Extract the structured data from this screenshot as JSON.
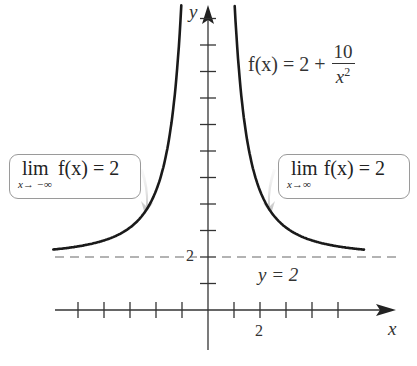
{
  "chart_data": {
    "type": "line",
    "title": "",
    "function": "f(x) = 2 + 10/x^2",
    "xlabel": "x",
    "ylabel": "y",
    "x_tick_step": 1,
    "x_ticks": [
      -5,
      -4,
      -3,
      -2,
      -1,
      1,
      2,
      3,
      4,
      5
    ],
    "x_tick_labels": [
      {
        "value": 2,
        "label": "2"
      }
    ],
    "y_ticks": [
      1,
      2,
      3,
      4,
      5,
      6,
      7,
      8,
      9,
      10,
      11
    ],
    "y_tick_labels": [
      {
        "value": 2,
        "label": "2"
      }
    ],
    "xlim": [
      -6,
      7
    ],
    "ylim": [
      -2,
      12
    ],
    "grid": false,
    "series": [
      {
        "name": "f(x) = 2 + 10/x^2 (left branch)",
        "x": [
          -6,
          -5,
          -4,
          -3,
          -2,
          -1.5,
          -1.2,
          -1.0
        ],
        "y": [
          2.28,
          2.4,
          2.63,
          3.11,
          4.5,
          6.44,
          8.94,
          12.0
        ]
      },
      {
        "name": "f(x) = 2 + 10/x^2 (right branch)",
        "x": [
          1.0,
          1.2,
          1.5,
          2,
          3,
          4,
          5,
          6
        ],
        "y": [
          12.0,
          8.94,
          6.44,
          4.5,
          3.11,
          2.63,
          2.4,
          2.28
        ]
      }
    ],
    "asymptote": {
      "type": "horizontal",
      "y": 2,
      "label": "y = 2",
      "style": "dashed"
    },
    "annotations": [
      {
        "text": "f(x) = 2 + 10/x²",
        "position": "upper right"
      },
      {
        "text": "lim x→−∞ f(x) = 2",
        "position": "left callout"
      },
      {
        "text": "lim x→∞ f(x) = 2",
        "position": "right callout"
      },
      {
        "text": "y = 2",
        "position": "below asymptote, right"
      }
    ]
  },
  "axes": {
    "x_label": "x",
    "y_label": "y",
    "x_tick_label": "2",
    "y_tick_label": "2"
  },
  "formula": {
    "lhs": "f(x) = 2 +",
    "numerator": "10",
    "denominator_base": "x",
    "denominator_exp": "2"
  },
  "asymptote_label": "y = 2",
  "callouts": {
    "left": {
      "lim": "lim",
      "sub": "x→ −∞",
      "expr": "f(x) = 2"
    },
    "right": {
      "lim": "lim",
      "sub": "x→∞",
      "expr": "f(x) = 2"
    }
  },
  "colors": {
    "curve": "#1a1a1a",
    "axes": "#333333",
    "asymptote": "#999999",
    "callout_border": "#9a9a9a",
    "arrow": "#c8c8c8"
  }
}
